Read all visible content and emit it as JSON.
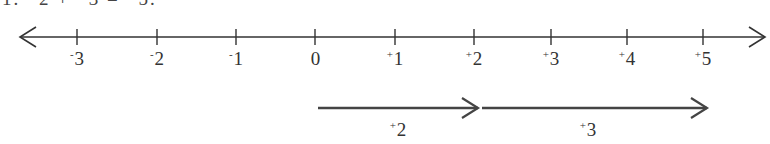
{
  "header": {
    "text": "1.  ⁺2  +  ⁺3  =  ⁺5."
  },
  "number_line": {
    "y": 37,
    "x_start": 20,
    "x_end": 765,
    "line_color": "#333333",
    "ticks": [
      {
        "value": -3,
        "sign": "-",
        "digit": "3",
        "x": 77
      },
      {
        "value": -2,
        "sign": "-",
        "digit": "2",
        "x": 157
      },
      {
        "value": -1,
        "sign": "-",
        "digit": "1",
        "x": 236
      },
      {
        "value": 0,
        "sign": "",
        "digit": "0",
        "x": 315
      },
      {
        "value": 1,
        "sign": "+",
        "digit": "1",
        "x": 395
      },
      {
        "value": 2,
        "sign": "+",
        "digit": "2",
        "x": 474
      },
      {
        "value": 3,
        "sign": "+",
        "digit": "3",
        "x": 551
      },
      {
        "value": 4,
        "sign": "+",
        "digit": "4",
        "x": 627
      },
      {
        "value": 5,
        "sign": "+",
        "digit": "5",
        "x": 703
      }
    ]
  },
  "jumps": [
    {
      "label_sign": "+",
      "label_digit": "2",
      "from_value": 0,
      "to_value": 2,
      "x1": 318,
      "x2": 478,
      "y": 108,
      "label_x": 398
    },
    {
      "label_sign": "+",
      "label_digit": "3",
      "from_value": 2,
      "to_value": 5,
      "x1": 482,
      "x2": 707,
      "y": 108,
      "label_x": 588
    }
  ]
}
